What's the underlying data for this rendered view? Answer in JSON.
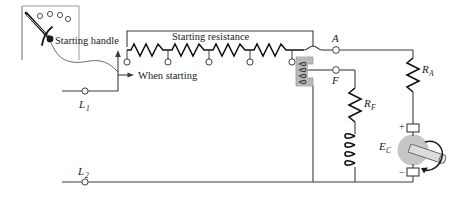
{
  "diagram": {
    "labels": {
      "starting_handle": "Starting handle",
      "starting_resistance": "Starting resistance",
      "when_starting": "When starting",
      "line_1": "L",
      "line_1_sub": "1",
      "line_2": "L",
      "line_2_sub": "2",
      "terminal_a": "A",
      "terminal_f": "F",
      "field_rheostat": "R",
      "field_rheostat_sub": "F",
      "armature_rheostat": "R",
      "armature_rheostat_sub": "A",
      "counter_emf": "E",
      "counter_emf_sub": "C",
      "polarity_positive": "+",
      "polarity_negative": "−"
    },
    "colors": {
      "wire": "#3d3d3d",
      "component": "#111111",
      "magnet_fill": "#b9b9b9",
      "armature_fill": "#c6c6c6",
      "shaft_fill": "#dcdcdc",
      "terminal_fill": "#ffffff",
      "box_border": "#9a9a9a",
      "text": "#1a1a1a"
    },
    "counts": {
      "resistor_sections": 4,
      "stud_contacts": 5,
      "faceplate_studs": 4,
      "field_coil_turns": 4,
      "holding_coil_turns": 4
    }
  }
}
